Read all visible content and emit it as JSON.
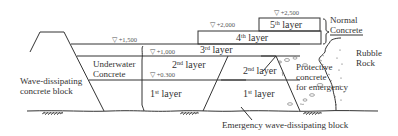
{
  "diagram": {
    "layers": [
      {
        "id": "layer-1-left",
        "label_num": "1",
        "label_sup": "st",
        "label_text": " layer"
      },
      {
        "id": "layer-2-left",
        "label_num": "2",
        "label_sup": "nd",
        "label_text": " layer"
      },
      {
        "id": "layer-3",
        "label_num": "3",
        "label_sup": "rd",
        "label_text": " layer"
      },
      {
        "id": "layer-4",
        "label_num": "4",
        "label_sup": "th",
        "label_text": " layer"
      },
      {
        "id": "layer-5",
        "label_num": "5",
        "label_sup": "th",
        "label_text": " layer"
      },
      {
        "id": "layer-1-right",
        "label_num": "1",
        "label_sup": "st",
        "label_text": " layer"
      },
      {
        "id": "layer-2-right",
        "label_num": "2",
        "label_sup": "nd",
        "label_text": " layer"
      }
    ],
    "elevations": [
      {
        "id": "elev-2500",
        "text": "▽ +2,500"
      },
      {
        "id": "elev-2000",
        "text": "▽ +2,000"
      },
      {
        "id": "elev-1500",
        "text": "▽ +1,500"
      },
      {
        "id": "elev-1000",
        "text": "▽ +1,000"
      },
      {
        "id": "elev-0300",
        "text": "▽ +0.300"
      }
    ],
    "annotations": {
      "normal_concrete": [
        "Normal",
        "Concrete"
      ],
      "rubble_rock": [
        "Rubble",
        "Rock"
      ],
      "underwater_concrete": [
        "Underwater",
        "Concrete"
      ],
      "wave_dissipating_block": [
        "Wave-dissipating",
        "concrete block"
      ],
      "protective_concrete": [
        "Protective",
        "concrete",
        "for emergency"
      ],
      "emergency_block": "Emergency wave-dissipating block"
    }
  }
}
